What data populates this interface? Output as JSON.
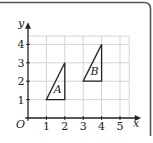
{
  "figure": {
    "frame_color": "#555555",
    "grid_color": "#d4d4d4",
    "axis_color": "#222222",
    "shape_color": "#222222"
  },
  "chart_data": {
    "type": "scatter",
    "title": "",
    "xlabel": "x",
    "ylabel": "y",
    "origin_label": "O",
    "xlim": [
      0,
      5
    ],
    "ylim": [
      0,
      4
    ],
    "x_ticks": [
      "1",
      "2",
      "3",
      "4",
      "5"
    ],
    "y_ticks": [
      "1",
      "2",
      "3",
      "4"
    ],
    "grid": true,
    "shapes": [
      {
        "name": "A",
        "label": "A",
        "vertices": [
          [
            1,
            1
          ],
          [
            2,
            1
          ],
          [
            2,
            3
          ]
        ],
        "label_pos": [
          1.62,
          1.55
        ]
      },
      {
        "name": "B",
        "label": "B",
        "vertices": [
          [
            3,
            2
          ],
          [
            4,
            2
          ],
          [
            4,
            4
          ]
        ],
        "label_pos": [
          3.62,
          2.55
        ]
      }
    ]
  }
}
